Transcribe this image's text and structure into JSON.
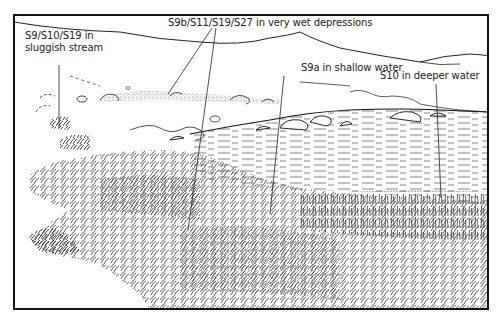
{
  "figure": {
    "type": "landscape line illustration",
    "frame_color": "#111111",
    "background": "#ffffff",
    "labels": [
      {
        "id": "label-stream",
        "lines": [
          "S9/S10/S19 in",
          "sluggish stream"
        ],
        "x": 25,
        "y": 38
      },
      {
        "id": "label-depressions",
        "lines": [
          "S9b/S11/S19/S27 in very wet depressions"
        ],
        "x": 167,
        "y": 21
      },
      {
        "id": "label-shallow",
        "lines": [
          "S9a in shallow water"
        ],
        "x": 300,
        "y": 66
      },
      {
        "id": "label-deeper",
        "lines": [
          "S10 in deeper water"
        ],
        "x": 380,
        "y": 72
      }
    ]
  }
}
